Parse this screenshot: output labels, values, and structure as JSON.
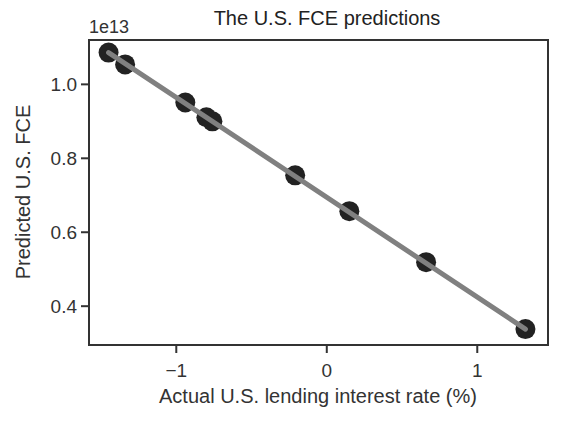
{
  "chart_data": {
    "type": "scatter",
    "title": "The U.S. FCE predictions",
    "xlabel": "Actual U.S. lending interest rate (%)",
    "ylabel": "Predicted U.S. FCE",
    "y_offset_label": "1e13",
    "xlim": [
      -1.58,
      1.47
    ],
    "ylim": [
      0.295,
      1.12
    ],
    "xticks": [
      -1,
      0,
      1
    ],
    "xtick_labels": [
      "−1",
      "0",
      "1"
    ],
    "yticks": [
      0.4,
      0.6,
      0.8,
      1.0
    ],
    "ytick_labels": [
      "0.4",
      "0.6",
      "0.8",
      "1.0"
    ],
    "grid": false,
    "series": [
      {
        "name": "points",
        "kind": "scatter",
        "color": "#222222",
        "x": [
          -1.45,
          -1.34,
          -0.94,
          -0.8,
          -0.76,
          -0.21,
          0.15,
          0.66,
          1.32
        ],
        "y": [
          1.086,
          1.054,
          0.951,
          0.911,
          0.9,
          0.754,
          0.657,
          0.519,
          0.338
        ]
      },
      {
        "name": "fit-line",
        "kind": "line",
        "color": "#808080",
        "x": [
          -1.45,
          1.32
        ],
        "y": [
          1.086,
          0.338
        ]
      }
    ]
  }
}
